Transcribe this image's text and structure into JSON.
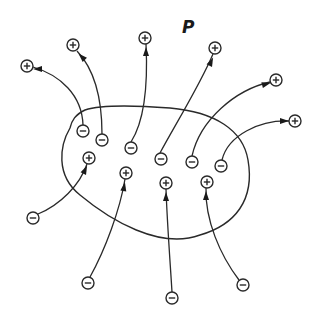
{
  "diagram": {
    "type": "electric-field-lines",
    "label": "P",
    "label_position": [
      182,
      33
    ],
    "charge_radius": 6,
    "colors": {
      "ink": "#2a2a2a",
      "background": "#ffffff"
    },
    "region_path": "M 70 128 C 60 145, 55 175, 80 195 C 110 220, 160 250, 200 235 C 235 225, 255 200, 248 160 C 243 130, 215 112, 170 108 C 130 105, 100 105, 85 110 C 75 115, 72 120, 70 128 Z",
    "charges": [
      {
        "id": "p-out-1",
        "sign": "+",
        "x": 27,
        "y": 66,
        "location": "outside"
      },
      {
        "id": "p-out-2",
        "sign": "+",
        "x": 73,
        "y": 45,
        "location": "outside"
      },
      {
        "id": "p-out-3",
        "sign": "+",
        "x": 145,
        "y": 38,
        "location": "outside"
      },
      {
        "id": "p-out-4",
        "sign": "+",
        "x": 215,
        "y": 48,
        "location": "outside"
      },
      {
        "id": "p-out-5",
        "sign": "+",
        "x": 276,
        "y": 80,
        "location": "outside"
      },
      {
        "id": "p-out-6",
        "sign": "+",
        "x": 295,
        "y": 121,
        "location": "outside"
      },
      {
        "id": "n-in-1",
        "sign": "-",
        "x": 83,
        "y": 131,
        "location": "inside"
      },
      {
        "id": "n-in-2",
        "sign": "-",
        "x": 102,
        "y": 140,
        "location": "inside"
      },
      {
        "id": "n-in-3",
        "sign": "-",
        "x": 131,
        "y": 148,
        "location": "inside"
      },
      {
        "id": "n-in-4",
        "sign": "-",
        "x": 161,
        "y": 159,
        "location": "inside"
      },
      {
        "id": "n-in-5",
        "sign": "-",
        "x": 192,
        "y": 162,
        "location": "inside"
      },
      {
        "id": "n-in-6",
        "sign": "-",
        "x": 221,
        "y": 166,
        "location": "inside"
      },
      {
        "id": "p-in-1",
        "sign": "+",
        "x": 89,
        "y": 158,
        "location": "inside"
      },
      {
        "id": "p-in-2",
        "sign": "+",
        "x": 126,
        "y": 173,
        "location": "inside"
      },
      {
        "id": "p-in-3",
        "sign": "+",
        "x": 166,
        "y": 183,
        "location": "inside"
      },
      {
        "id": "p-in-4",
        "sign": "+",
        "x": 207,
        "y": 182,
        "location": "inside"
      },
      {
        "id": "n-out-1",
        "sign": "-",
        "x": 33,
        "y": 218,
        "location": "outside"
      },
      {
        "id": "n-out-2",
        "sign": "-",
        "x": 88,
        "y": 283,
        "location": "outside"
      },
      {
        "id": "n-out-3",
        "sign": "-",
        "x": 172,
        "y": 298,
        "location": "outside"
      },
      {
        "id": "n-out-4",
        "sign": "-",
        "x": 243,
        "y": 285,
        "location": "outside"
      }
    ],
    "field_lines": [
      {
        "from": "n-in-1",
        "to": "p-out-1",
        "path": "M 83 125 C 82 95, 60 75, 33 67",
        "arrow": [
          38,
          69,
          180
        ]
      },
      {
        "from": "n-in-2",
        "to": "p-out-2",
        "path": "M 102 134 C 102 100, 95 70, 77 51",
        "arrow": [
          82,
          57,
          225
        ]
      },
      {
        "from": "n-in-3",
        "to": "p-out-3",
        "path": "M 131 142 C 145 120, 148 85, 146 44",
        "arrow": [
          146,
          52,
          270
        ]
      },
      {
        "from": "n-in-4",
        "to": "p-out-4",
        "path": "M 160 153 C 175 125, 200 85, 213 54",
        "arrow": [
          211,
          62,
          295
        ]
      },
      {
        "from": "n-in-5",
        "to": "p-out-5",
        "path": "M 192 156 C 200 120, 235 90, 270 82",
        "arrow": [
          266,
          84,
          345
        ]
      },
      {
        "from": "n-in-6",
        "to": "p-out-6",
        "path": "M 222 160 C 228 135, 260 120, 289 121",
        "arrow": [
          284,
          121,
          0
        ]
      },
      {
        "from": "n-out-1",
        "to": "p-in-1",
        "path": "M 38 214 C 60 205, 80 185, 87 164",
        "arrow": [
          85,
          170,
          295
        ]
      },
      {
        "from": "n-out-2",
        "to": "p-in-2",
        "path": "M 90 277 C 105 250, 120 210, 125 179",
        "arrow": [
          124,
          187,
          280
        ]
      },
      {
        "from": "n-out-3",
        "to": "p-in-3",
        "path": "M 172 292 C 170 260, 167 220, 166 189",
        "arrow": [
          166,
          197,
          270
        ]
      },
      {
        "from": "n-out-4",
        "to": "p-in-4",
        "path": "M 239 280 C 220 255, 205 220, 206 188",
        "arrow": [
          206,
          196,
          270
        ]
      }
    ]
  }
}
